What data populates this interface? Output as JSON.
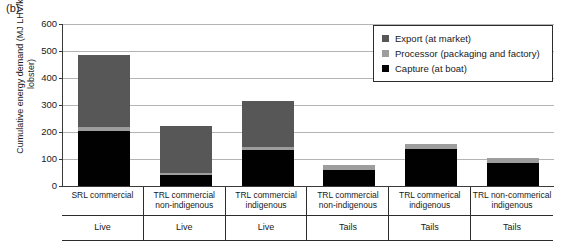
{
  "figure": {
    "panel_letter": "(b)"
  },
  "chart_data": {
    "type": "bar",
    "title": "",
    "subtitle": "",
    "xlabel": "",
    "ylabel": "Cumulative energy demand (MJ LHV/kg lobster)",
    "ylim": [
      0,
      600
    ],
    "yticks": [
      0,
      100,
      200,
      300,
      400,
      500,
      600
    ],
    "ytick_labels": [
      "0",
      "100",
      "200",
      "300",
      "400",
      "500",
      "600"
    ],
    "grid": true,
    "stacked": true,
    "legend_position": "top-right",
    "categories": [
      "SRL commercial",
      "TRL commercial non-indigenous",
      "TRL commercial indigenous",
      "TRL commercial non-indigenous",
      "TRL commerical indigenous",
      "TRL non-commerical indigenous"
    ],
    "category_lines": [
      [
        "SRL commercial",
        ""
      ],
      [
        "TRL commercial",
        "non-indigenous"
      ],
      [
        "TRL commercial",
        "indigenous"
      ],
      [
        "TRL commercial",
        "non-indigenous"
      ],
      [
        "TRL commerical",
        "indigenous"
      ],
      [
        "TRL non-commerical",
        "indigenous"
      ]
    ],
    "product_forms": [
      "Live",
      "Live",
      "Live",
      "Tails",
      "Tails",
      "Tails"
    ],
    "series": [
      {
        "name": "Capture (at boat)",
        "color": "#010101",
        "values": [
          205,
          40,
          133,
          60,
          137,
          85
        ]
      },
      {
        "name": "Processor (packaging and factory)",
        "color": "#9d9d9d",
        "values": [
          15,
          8,
          12,
          18,
          18,
          18
        ]
      },
      {
        "name": "Export (at market)",
        "color": "#575757",
        "values": [
          265,
          174,
          170,
          0,
          0,
          0
        ]
      }
    ],
    "totals": [
      485,
      222,
      315,
      78,
      155,
      103
    ]
  },
  "legend": {
    "items": [
      {
        "label": "Export (at market)",
        "color": "#575757"
      },
      {
        "label": "Processor (packaging and factory)",
        "color": "#9d9d9d"
      },
      {
        "label": "Capture (at boat)",
        "color": "#010101"
      }
    ]
  }
}
